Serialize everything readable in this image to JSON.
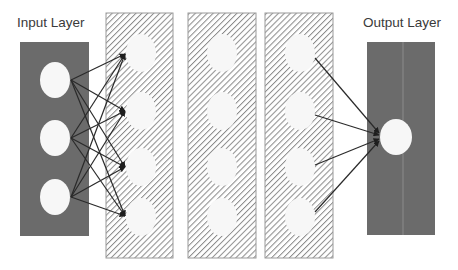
{
  "diagram": {
    "type": "neural-network",
    "labels": {
      "input": "Input Layer",
      "output": "Output Layer"
    },
    "colors": {
      "solid_panel": "#6b6b6b",
      "hatch_line": "#8a8a8a",
      "node_fill": "#f7f7f7",
      "edge": "#2a2a2a"
    },
    "layers": [
      {
        "name": "input",
        "style": "solid",
        "nodes": 3
      },
      {
        "name": "hidden-1",
        "style": "hatched",
        "nodes": 4
      },
      {
        "name": "hidden-2",
        "style": "hatched",
        "nodes": 4
      },
      {
        "name": "hidden-3",
        "style": "hatched",
        "nodes": 4
      },
      {
        "name": "output",
        "style": "solid",
        "nodes": 1
      }
    ],
    "connections": [
      {
        "from": "input",
        "to": "hidden-1",
        "type": "fully-connected",
        "arrows": 12
      },
      {
        "from": "hidden-3",
        "to": "output",
        "type": "fully-connected",
        "arrows": 4
      }
    ]
  }
}
